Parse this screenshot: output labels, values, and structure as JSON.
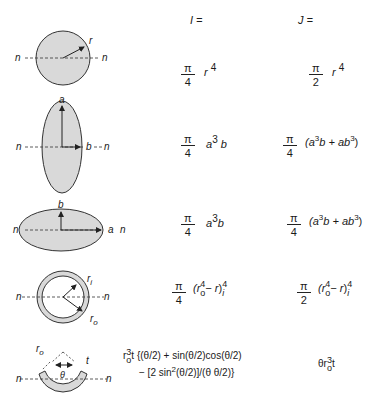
{
  "headers": {
    "I": "I =",
    "J": "J ="
  },
  "rows": [
    {
      "shape": "solid-circle",
      "labels": {
        "radius": "r",
        "axis_left": "n",
        "axis_right": "n"
      },
      "I": {
        "num": "π",
        "den": "4",
        "expr": "r",
        "exp": "4"
      },
      "J": {
        "num": "π",
        "den": "2",
        "expr": "r",
        "exp": "4"
      }
    },
    {
      "shape": "vertical-ellipse",
      "labels": {
        "top": "a",
        "right": "b",
        "axis_left": "n",
        "axis_right": "n"
      },
      "I": {
        "num": "π",
        "den": "4",
        "expr_a": "a",
        "exp_a": "3",
        "expr_b": "b"
      },
      "J": {
        "num": "π",
        "den": "4",
        "text_open": "(a",
        "exp1": "3",
        "mid": "b + ab",
        "exp2": "3",
        "text_close": ")"
      }
    },
    {
      "shape": "horizontal-ellipse",
      "labels": {
        "top": "b",
        "right": "a",
        "axis_left": "n",
        "axis_right": "n"
      },
      "I": {
        "num": "π",
        "den": "4",
        "expr_a": "a",
        "exp_a": "3",
        "expr_b": "b"
      },
      "J": {
        "num": "π",
        "den": "4",
        "text_open": "(a",
        "exp1": "3",
        "mid": "b + ab",
        "exp2": "3",
        "text_close": ")"
      }
    },
    {
      "shape": "hollow-circle",
      "labels": {
        "inner": "r",
        "inner_sub": "i",
        "outer": "r",
        "outer_sub": "o",
        "axis_left": "n",
        "axis_right": "n"
      },
      "I": {
        "num": "π",
        "den": "4",
        "open": "(r",
        "sub_o": "o",
        "exp_o": "4",
        "minus": "− r",
        "close": ")",
        "sub_i": "i",
        "exp_i": "4"
      },
      "J": {
        "num": "π",
        "den": "2",
        "open": "(r",
        "sub_o": "o",
        "exp_o": "4",
        "minus": "− r",
        "close": ")",
        "sub_i": "i",
        "exp_i": "4"
      }
    },
    {
      "shape": "thin-arc",
      "labels": {
        "radius": "r",
        "radius_sub": "o",
        "thickness": "t",
        "angle": "θ",
        "axis_left": "n",
        "axis_right": "n"
      },
      "I": {
        "lead": "r",
        "lead_sub": "o",
        "lead_exp": "3",
        "lead_t": "t",
        "line1": "{(θ/2) + sin(θ/2)cos(θ/2)",
        "line2_a": "− [2 sin",
        "line2_exp": "2",
        "line2_b": "(θ/2)]/(θ θ/2)}"
      },
      "J": {
        "lead": "θr",
        "sub": "o",
        "exp": "3",
        "tail": "t"
      }
    }
  ],
  "colors": {
    "fill": "#d9d9d9",
    "stroke": "#333333",
    "text": "#1a1a1a"
  }
}
